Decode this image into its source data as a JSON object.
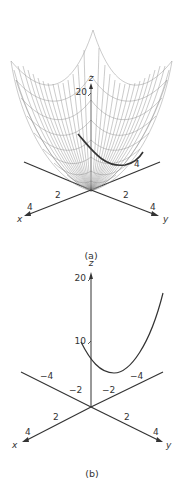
{
  "figure": {
    "panels": [
      {
        "id": "a",
        "caption": "(a)",
        "description": "3D mesh surface (paraboloid) with a highlighted cross-section curve",
        "axes": {
          "x_label": "x",
          "y_label": "y",
          "z_label": "z",
          "x_ticks": [
            "2",
            "4"
          ],
          "y_ticks": [
            "2",
            "4"
          ],
          "y_neg_tick": "4",
          "z_ticks": [
            "20"
          ]
        }
      },
      {
        "id": "b",
        "caption": "(b)",
        "description": "3D axes with a single parabolic curve (cross-section of the surface)",
        "axes": {
          "x_label": "x",
          "y_label": "y",
          "z_label": "z",
          "x_ticks": [
            "2",
            "4"
          ],
          "x_neg_ticks": [
            "−2",
            "−4"
          ],
          "y_ticks": [
            "2",
            "4"
          ],
          "y_neg_ticks": [
            "−2",
            "−4"
          ],
          "z_ticks": [
            "10",
            "20"
          ]
        }
      }
    ]
  }
}
